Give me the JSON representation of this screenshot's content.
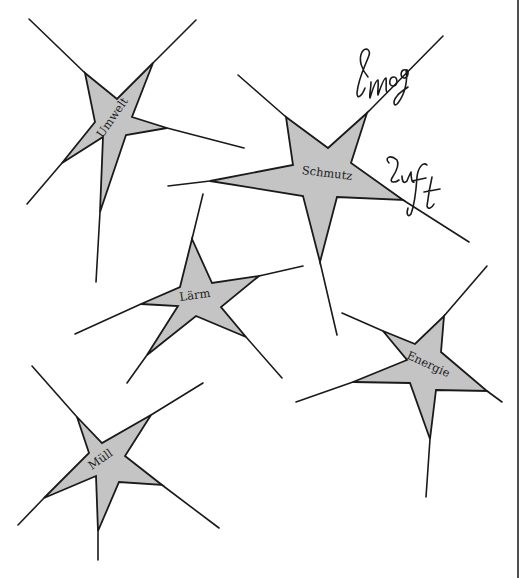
{
  "diagram": {
    "type": "star-cluster",
    "colors": {
      "background": "#ffffff",
      "star_fill": "#c4c4c4",
      "stroke": "#1a1a1a"
    },
    "stars": [
      {
        "id": "umwelt",
        "label": "Umwelt",
        "label_pos": [
          113,
          118
        ],
        "label_rotation": -55
      },
      {
        "id": "schmutz",
        "label": "Schmutz",
        "label_pos": [
          327,
          174
        ],
        "label_rotation": 7
      },
      {
        "id": "laerm",
        "label": "Lärm",
        "label_pos": [
          195,
          296
        ],
        "label_rotation": -8
      },
      {
        "id": "energie",
        "label": "Energie",
        "label_pos": [
          428,
          365
        ],
        "label_rotation": 25
      },
      {
        "id": "muell",
        "label": "Müll",
        "label_pos": [
          101,
          460
        ],
        "label_rotation": -35
      }
    ],
    "annotations": [
      {
        "id": "smog",
        "text": "Smog",
        "style": "handwritten"
      },
      {
        "id": "luft",
        "text": "Luft",
        "style": "handwritten"
      }
    ]
  }
}
